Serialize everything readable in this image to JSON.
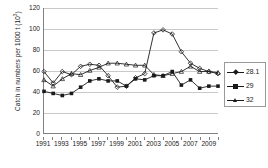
{
  "chart_data": {
    "type": "line",
    "title": "",
    "xlabel": "",
    "ylabel": "Catch in numbers per 1000 t (10",
    "ylabel_sup": "3",
    "ylabel_tail": ")",
    "ylim": [
      0,
      120
    ],
    "xlim": [
      1991,
      2010
    ],
    "grid": true,
    "legend_position": "right",
    "y_ticks": [
      0,
      20,
      40,
      60,
      80,
      100,
      120
    ],
    "x_ticks": [
      1991,
      1992,
      1993,
      1994,
      1995,
      1996,
      1997,
      1998,
      1999,
      2000,
      2001,
      2002,
      2003,
      2004,
      2005,
      2006,
      2007,
      2008,
      2009,
      2010
    ],
    "x_tick_labels": [
      "1991",
      "",
      "1993",
      "",
      "1995",
      "",
      "1997",
      "",
      "1999",
      "",
      "2001",
      "",
      "2003",
      "",
      "2005",
      "",
      "2007",
      "",
      "2009",
      ""
    ],
    "x": [
      1991,
      1992,
      1993,
      1994,
      1995,
      1996,
      1997,
      1998,
      1999,
      2000,
      2001,
      2002,
      2003,
      2004,
      2005,
      2006,
      2007,
      2008,
      2009,
      2010
    ],
    "series": [
      {
        "name": "28.1",
        "marker": "diamond",
        "color": "#1a1a1a",
        "values": [
          59,
          48,
          59,
          56,
          64,
          66,
          65,
          55,
          44,
          45,
          53,
          57,
          96,
          99,
          95,
          78,
          67,
          62,
          59,
          57
        ]
      },
      {
        "name": "29",
        "marker": "square",
        "color": "#1a1a1a",
        "values": [
          40,
          38,
          36,
          38,
          44,
          50,
          52,
          50,
          50,
          45,
          52,
          51,
          55,
          55,
          59,
          46,
          51,
          43,
          45,
          45
        ]
      },
      {
        "name": "32",
        "marker": "triangle",
        "color": "#1a1a1a",
        "values": [
          51,
          45,
          52,
          57,
          56,
          60,
          63,
          67,
          67,
          66,
          65,
          65,
          56,
          55,
          57,
          59,
          64,
          59,
          59,
          58
        ]
      }
    ]
  },
  "legend": {
    "items": [
      {
        "label": "28.1",
        "marker": "diamond"
      },
      {
        "label": "29",
        "marker": "square"
      },
      {
        "label": "32",
        "marker": "triangle"
      }
    ]
  }
}
